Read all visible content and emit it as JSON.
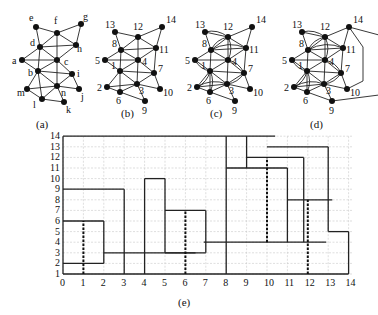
{
  "figures": {
    "a": {
      "caption": "(a)",
      "nodes": [
        {
          "id": "e",
          "x": 36,
          "y": 27,
          "lx": 29,
          "ly": 21
        },
        {
          "id": "f",
          "x": 57,
          "y": 33,
          "lx": 54,
          "ly": 24
        },
        {
          "id": "g",
          "x": 81,
          "y": 24,
          "lx": 83,
          "ly": 20
        },
        {
          "id": "d",
          "x": 40,
          "y": 47,
          "lx": 30,
          "ly": 46
        },
        {
          "id": "h",
          "x": 76,
          "y": 45,
          "lx": 77,
          "ly": 52
        },
        {
          "id": "a",
          "x": 22,
          "y": 60,
          "lx": 12,
          "ly": 64
        },
        {
          "id": "c",
          "x": 57,
          "y": 60,
          "lx": 64,
          "ly": 65
        },
        {
          "id": "b",
          "x": 38,
          "y": 71,
          "lx": 28,
          "ly": 76
        },
        {
          "id": "i",
          "x": 72,
          "y": 74,
          "lx": 77,
          "ly": 77
        },
        {
          "id": "m",
          "x": 27,
          "y": 89,
          "lx": 17,
          "ly": 96
        },
        {
          "id": "n",
          "x": 57,
          "y": 86,
          "lx": 61,
          "ly": 96
        },
        {
          "id": "j",
          "x": 79,
          "y": 89,
          "lx": 81,
          "ly": 100
        },
        {
          "id": "l",
          "x": 42,
          "y": 99,
          "lx": 33,
          "ly": 108
        },
        {
          "id": "k",
          "x": 64,
          "y": 102,
          "lx": 66,
          "ly": 113
        }
      ],
      "edges": [
        [
          "e",
          "f"
        ],
        [
          "f",
          "g"
        ],
        [
          "g",
          "h"
        ],
        [
          "f",
          "h"
        ],
        [
          "e",
          "d"
        ],
        [
          "d",
          "f"
        ],
        [
          "d",
          "h"
        ],
        [
          "d",
          "c"
        ],
        [
          "f",
          "c"
        ],
        [
          "h",
          "c"
        ],
        [
          "a",
          "d"
        ],
        [
          "a",
          "c"
        ],
        [
          "a",
          "b"
        ],
        [
          "b",
          "d"
        ],
        [
          "b",
          "c"
        ],
        [
          "c",
          "i"
        ],
        [
          "b",
          "i"
        ],
        [
          "b",
          "m"
        ],
        [
          "b",
          "n"
        ],
        [
          "b",
          "l"
        ],
        [
          "c",
          "n"
        ],
        [
          "i",
          "n"
        ],
        [
          "i",
          "j"
        ],
        [
          "n",
          "j"
        ],
        [
          "m",
          "n"
        ],
        [
          "m",
          "l"
        ],
        [
          "l",
          "n"
        ],
        [
          "l",
          "k"
        ],
        [
          "n",
          "k"
        ]
      ]
    },
    "b": {
      "caption": "(b)",
      "nodes": [
        {
          "id": "13",
          "x": 115,
          "y": 32
        },
        {
          "id": "12",
          "x": 138,
          "y": 37
        },
        {
          "id": "14",
          "x": 162,
          "y": 27
        },
        {
          "id": "8",
          "x": 121,
          "y": 50
        },
        {
          "id": "11",
          "x": 156,
          "y": 48
        },
        {
          "id": "5",
          "x": 105,
          "y": 60
        },
        {
          "id": "4",
          "x": 138,
          "y": 60
        },
        {
          "id": "1",
          "x": 120,
          "y": 71
        },
        {
          "id": "7",
          "x": 154,
          "y": 73
        },
        {
          "id": "2",
          "x": 107,
          "y": 87
        },
        {
          "id": "3",
          "x": 137,
          "y": 84
        },
        {
          "id": "10",
          "x": 160,
          "y": 89
        },
        {
          "id": "6",
          "x": 120,
          "y": 92
        },
        {
          "id": "9",
          "x": 145,
          "y": 101
        }
      ]
    },
    "c": {
      "caption": "(c)"
    },
    "d": {
      "caption": "(d)"
    },
    "e": {
      "caption": "(e)"
    }
  },
  "chart_data": {
    "type": "rectangular-layout",
    "caption": "(e)",
    "x_ticks": [
      "0",
      "1",
      "2",
      "3",
      "4",
      "5",
      "6",
      "7",
      "8",
      "9",
      "10",
      "11",
      "12",
      "13",
      "14"
    ],
    "y_ticks": [
      "1",
      "2",
      "3",
      "4",
      "5",
      "6",
      "7",
      "8",
      "9",
      "10",
      "11",
      "12",
      "13",
      "14"
    ],
    "xlim": [
      0,
      14
    ],
    "ylim": [
      1,
      14
    ],
    "grid": true,
    "horizontal_segments": [
      {
        "y": 14,
        "x1": 0,
        "x2": 10.4
      },
      {
        "y": 9,
        "x1": 0,
        "x2": 3
      },
      {
        "y": 6,
        "x1": 0,
        "x2": 2
      },
      {
        "y": 2,
        "x1": 0,
        "x2": 2
      },
      {
        "y": 3,
        "x1": 2,
        "x2": 6.5
      },
      {
        "y": 10,
        "x1": 4,
        "x2": 5
      },
      {
        "y": 7,
        "x1": 5,
        "x2": 7
      },
      {
        "y": 3,
        "x1": 5,
        "x2": 7
      },
      {
        "y": 4,
        "x1": 6.9,
        "x2": 12.9
      },
      {
        "y": 13,
        "x1": 10,
        "x2": 13
      },
      {
        "y": 12,
        "x1": 9,
        "x2": 11.8
      },
      {
        "y": 11,
        "x1": 8,
        "x2": 11
      },
      {
        "y": 8,
        "x1": 11,
        "x2": 13.2
      },
      {
        "y": 5,
        "x1": 13,
        "x2": 14
      },
      {
        "y": 1,
        "x1": 0,
        "x2": 14
      }
    ],
    "vertical_segments": [
      {
        "x": 0,
        "y1": 1,
        "y2": 14
      },
      {
        "x": 2,
        "y1": 2,
        "y2": 6
      },
      {
        "x": 3,
        "y1": 1,
        "y2": 9
      },
      {
        "x": 4,
        "y1": 1,
        "y2": 10
      },
      {
        "x": 5,
        "y1": 3,
        "y2": 10
      },
      {
        "x": 7,
        "y1": 3,
        "y2": 7
      },
      {
        "x": 8,
        "y1": 1,
        "y2": 14
      },
      {
        "x": 9,
        "y1": 11,
        "y2": 14
      },
      {
        "x": 11,
        "y1": 4,
        "y2": 11
      },
      {
        "x": 11.8,
        "y1": 4,
        "y2": 12
      },
      {
        "x": 13,
        "y1": 5,
        "y2": 13
      },
      {
        "x": 14,
        "y1": 1,
        "y2": 5
      }
    ],
    "dashed_segments": [
      {
        "x": 1,
        "y1": 1,
        "y2": 6
      },
      {
        "x": 6,
        "y1": 1,
        "y2": 7
      },
      {
        "x": 10,
        "y1": 4,
        "y2": 12
      },
      {
        "x": 12,
        "y1": 1,
        "y2": 8
      }
    ]
  }
}
